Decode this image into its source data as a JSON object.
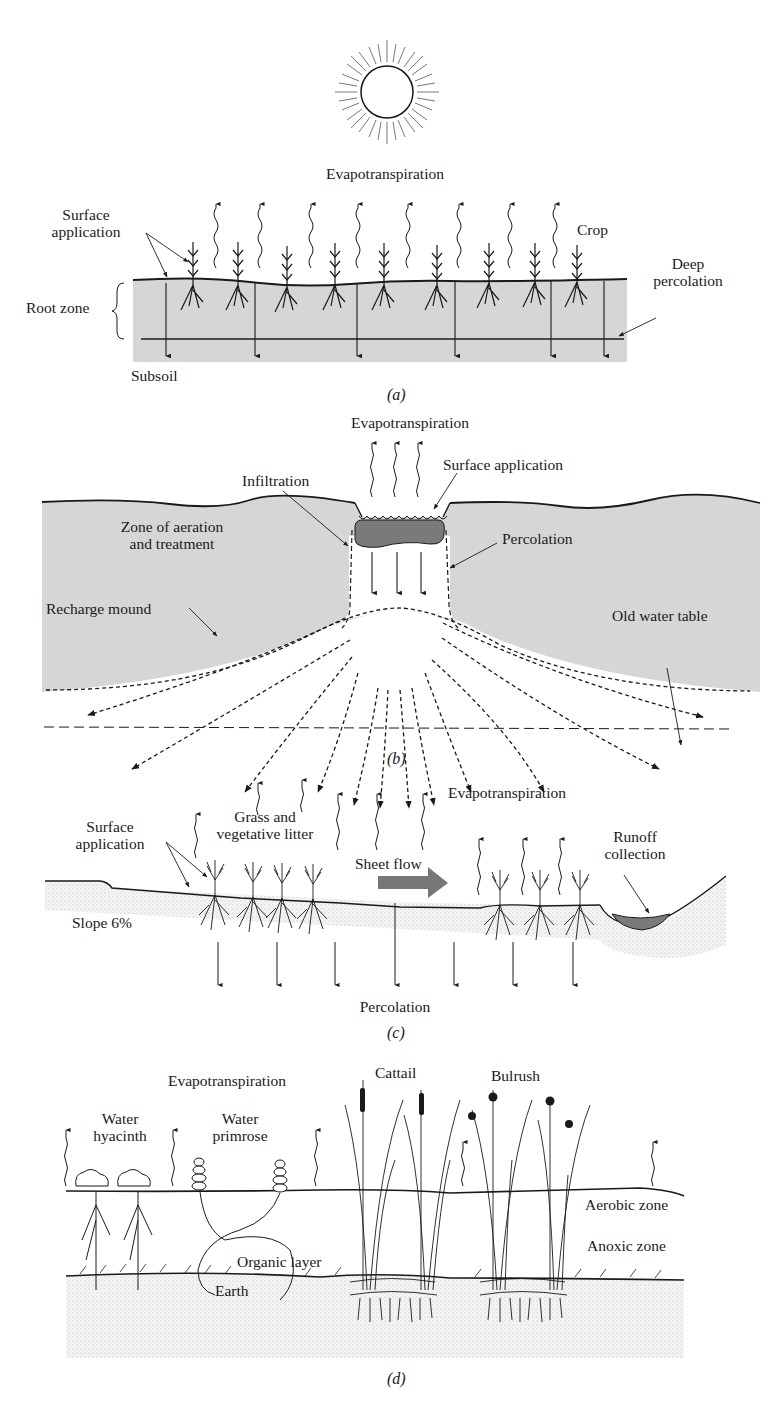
{
  "figure": {
    "panels": [
      {
        "id": "a",
        "caption": "(a)",
        "labels": {
          "evapotranspiration": "Evapotranspiration",
          "surface_application_1": "Surface",
          "surface_application_2": "application",
          "crop": "Crop",
          "deep_percolation_1": "Deep",
          "deep_percolation_2": "percolation",
          "root_zone": "Root zone",
          "subsoil": "Subsoil"
        }
      },
      {
        "id": "b",
        "caption": "(b)",
        "labels": {
          "evapotranspiration": "Evapotranspiration",
          "surface_application": "Surface application",
          "infiltration": "Infiltration",
          "zone_aeration_1": "Zone of aeration",
          "zone_aeration_2": "and treatment",
          "percolation": "Percolation",
          "recharge_mound": "Recharge mound",
          "old_water_table": "Old water table"
        }
      },
      {
        "id": "c",
        "caption": "(c)",
        "labels": {
          "surface_application_1": "Surface",
          "surface_application_2": "application",
          "grass_1": "Grass and",
          "grass_2": "vegetative litter",
          "evapotranspiration": "Evapotranspiration",
          "sheet_flow": "Sheet flow",
          "runoff_1": "Runoff",
          "runoff_2": "collection",
          "slope": "Slope 6%",
          "percolation": "Percolation"
        }
      },
      {
        "id": "d",
        "caption": "(d)",
        "labels": {
          "evapotranspiration": "Evapotranspiration",
          "cattail": "Cattail",
          "bulrush": "Bulrush",
          "water_hyacinth_1": "Water",
          "water_hyacinth_2": "hyacinth",
          "water_primrose_1": "Water",
          "water_primrose_2": "primrose",
          "aerobic_zone": "Aerobic zone",
          "anoxic_zone": "Anoxic zone",
          "organic_layer": "Organic layer",
          "earth": "Earth"
        }
      }
    ],
    "colors": {
      "soil_fill": "#d6d6d6",
      "pond_fill": "#7a7a7a",
      "ink": "#1a1a1a"
    }
  }
}
